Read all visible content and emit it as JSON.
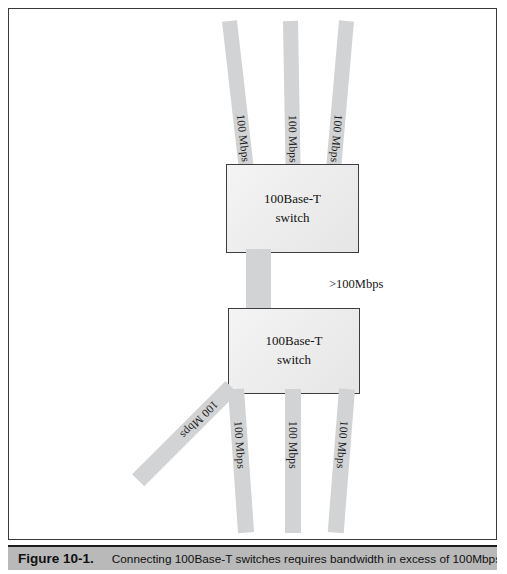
{
  "figure": {
    "caption_number": "Figure 10-1.",
    "caption_text": "Connecting 100Base-T switches requires bandwidth in excess of 100Mbps"
  },
  "colors": {
    "cable": "#d2d3d4",
    "switch_fill": "#ececec",
    "switch_border": "#3d3d3f",
    "frame_border": "#3a3a3c",
    "caption_band": "#b9b9b9",
    "text": "#111111"
  },
  "diagram": {
    "type": "network-topology",
    "uplink_label": ">100Mbps",
    "switches": [
      {
        "id": "upper-switch",
        "line1": "100Base-T",
        "line2": "switch",
        "x": 225,
        "y": 163,
        "width": 133,
        "height": 89
      },
      {
        "id": "lower-switch",
        "line1": "100Base-T",
        "line2": "switch",
        "x": 227,
        "y": 307,
        "width": 132,
        "height": 86
      }
    ],
    "cables": [
      {
        "id": "top-cable-1",
        "label": "100 Mbps",
        "attaches": "upper-switch",
        "side": "top"
      },
      {
        "id": "top-cable-2",
        "label": "100 Mbps",
        "attaches": "upper-switch",
        "side": "top"
      },
      {
        "id": "top-cable-3",
        "label": "100 Mbps",
        "attaches": "upper-switch",
        "side": "top"
      },
      {
        "id": "uplink-cable",
        "label": "",
        "attaches": "both",
        "side": "between"
      },
      {
        "id": "bottom-cable-1",
        "label": "100 Mbps",
        "attaches": "lower-switch",
        "side": "bottom-left-diagonal"
      },
      {
        "id": "bottom-cable-2",
        "label": "100 Mbps",
        "attaches": "lower-switch",
        "side": "bottom"
      },
      {
        "id": "bottom-cable-3",
        "label": "100 Mbps",
        "attaches": "lower-switch",
        "side": "bottom"
      },
      {
        "id": "bottom-cable-4",
        "label": "100 Mbps",
        "attaches": "lower-switch",
        "side": "bottom"
      }
    ]
  }
}
